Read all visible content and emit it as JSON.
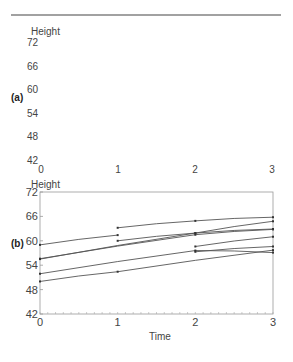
{
  "figure": {
    "top_rule": true
  },
  "chart_data": [
    {
      "panel": "(a)",
      "type": "line",
      "title": "",
      "xlabel": "",
      "ylabel": "Height",
      "x_ticks": [
        0,
        1,
        2,
        3
      ],
      "y_ticks": [
        72,
        66,
        60,
        54,
        48,
        42
      ],
      "ylim": [
        42,
        72
      ],
      "xlim": [
        0,
        3
      ],
      "grid": false,
      "frame": false,
      "series": []
    },
    {
      "panel": "(b)",
      "type": "line",
      "title": "",
      "xlabel": "Time",
      "ylabel": "Height",
      "x_ticks": [
        0,
        1,
        2,
        3
      ],
      "y_ticks": [
        72,
        66,
        60,
        54,
        48,
        42
      ],
      "ylim": [
        42,
        72
      ],
      "xlim": [
        0,
        3
      ],
      "grid": false,
      "frame": true,
      "line_color": "#555555",
      "series": [
        {
          "name": "subject-1",
          "x": [
            0,
            1
          ],
          "y": [
            59.0,
            61.4
          ]
        },
        {
          "name": "subject-2",
          "x": [
            0,
            2,
            3
          ],
          "y": [
            55.5,
            61.9,
            64.8
          ]
        },
        {
          "name": "subject-3",
          "x": [
            0,
            2,
            3
          ],
          "y": [
            55.6,
            61.5,
            62.8
          ]
        },
        {
          "name": "subject-4",
          "x": [
            0,
            2,
            3
          ],
          "y": [
            51.9,
            57.6,
            57.1
          ]
        },
        {
          "name": "subject-5",
          "x": [
            0,
            1,
            3
          ],
          "y": [
            50.0,
            52.4,
            57.7
          ]
        },
        {
          "name": "subject-6",
          "x": [
            1,
            2,
            3
          ],
          "y": [
            63.2,
            64.9,
            65.8
          ]
        },
        {
          "name": "subject-7",
          "x": [
            1,
            2,
            3
          ],
          "y": [
            60.0,
            61.9,
            62.9
          ]
        },
        {
          "name": "subject-8",
          "x": [
            2,
            3
          ],
          "y": [
            58.6,
            61.0
          ]
        },
        {
          "name": "subject-9",
          "x": [
            2,
            3
          ],
          "y": [
            57.3,
            58.6
          ]
        }
      ]
    }
  ]
}
